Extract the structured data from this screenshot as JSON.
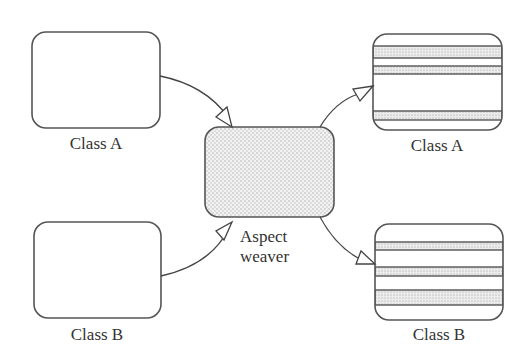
{
  "diagram": {
    "type": "aspect-weaving",
    "colors": {
      "stroke": "#555555",
      "text": "#333333",
      "dots": "#bdbdbd",
      "background": "#ffffff"
    },
    "inputs": [
      {
        "label": "Class A"
      },
      {
        "label": "Class B"
      }
    ],
    "weaver": {
      "label_line1": "Aspect",
      "label_line2": "weaver"
    },
    "outputs": [
      {
        "label": "Class A"
      },
      {
        "label": "Class B"
      }
    ]
  }
}
